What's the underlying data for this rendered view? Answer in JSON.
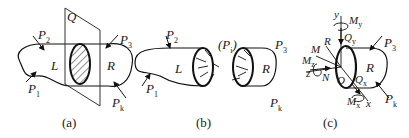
{
  "figure": {
    "panels": [
      {
        "id": "a",
        "caption": "(a)",
        "labels": {
          "plane": "Q",
          "left": "L",
          "right": "R",
          "p1": "P",
          "p1_sub": "1",
          "p2": "P",
          "p2_sub": "2",
          "p3": "P",
          "p3_sub": "3",
          "pk": "P",
          "pk_sub": "k"
        }
      },
      {
        "id": "b",
        "caption": "(b)",
        "labels": {
          "left": "L",
          "right": "R",
          "pi": "(P",
          "pi_sub": "i",
          "pi_close": ")",
          "p1": "P",
          "p1_sub": "1",
          "p2": "P",
          "p2_sub": "2",
          "p3": "P",
          "p3_sub": "3",
          "pk": "P",
          "pk_sub": "k"
        }
      },
      {
        "id": "c",
        "caption": "(c)",
        "labels": {
          "right": "R",
          "origin": "O",
          "y": "y",
          "z": "z",
          "x": "x",
          "my": "M",
          "my_sub": "y",
          "mz": "M",
          "mz_sub": "z",
          "mx": "M",
          "mx_sub": "x",
          "qy": "Q",
          "qy_sub": "y",
          "qx": "Q",
          "qx_sub": "x",
          "n": "N",
          "rvec": "R",
          "mvec": "M",
          "p3": "P",
          "p3_sub": "3",
          "pk": "P",
          "pk_sub": "k"
        }
      }
    ]
  }
}
